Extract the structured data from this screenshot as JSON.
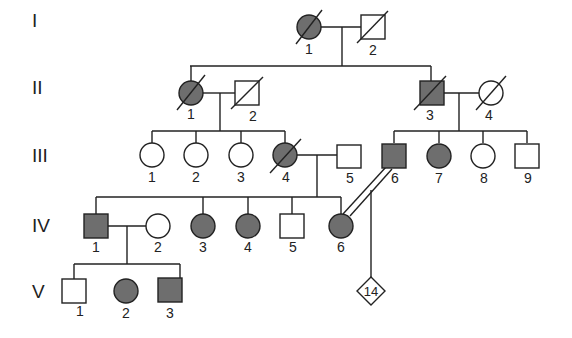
{
  "diagram": {
    "type": "pedigree",
    "colors": {
      "affected_fill": "#6e6e6e",
      "unaffected_fill": "#ffffff",
      "stroke": "#222222",
      "background": "#ffffff"
    },
    "generations": [
      {
        "label": "I",
        "y": 20
      },
      {
        "label": "II",
        "y": 86
      },
      {
        "label": "III",
        "y": 148
      },
      {
        "label": "IV",
        "y": 220
      },
      {
        "label": "V",
        "y": 286
      }
    ],
    "individuals": [
      {
        "id": "I-1",
        "label": "1",
        "sex": "female",
        "affected": true,
        "deceased": true,
        "x": 309,
        "y": 27
      },
      {
        "id": "I-2",
        "label": "2",
        "sex": "male",
        "affected": false,
        "deceased": true,
        "x": 373,
        "y": 27
      },
      {
        "id": "II-1",
        "label": "1",
        "sex": "female",
        "affected": true,
        "deceased": true,
        "x": 191,
        "y": 93
      },
      {
        "id": "II-2",
        "label": "2",
        "sex": "male",
        "affected": false,
        "deceased": true,
        "x": 247,
        "y": 93
      },
      {
        "id": "II-3",
        "label": "3",
        "sex": "male",
        "affected": true,
        "deceased": true,
        "x": 432,
        "y": 93
      },
      {
        "id": "II-4",
        "label": "4",
        "sex": "female",
        "affected": false,
        "deceased": true,
        "x": 491,
        "y": 93
      },
      {
        "id": "III-1",
        "label": "1",
        "sex": "female",
        "affected": false,
        "deceased": false,
        "x": 152,
        "y": 155
      },
      {
        "id": "III-2",
        "label": "2",
        "sex": "female",
        "affected": false,
        "deceased": false,
        "x": 196,
        "y": 155
      },
      {
        "id": "III-3",
        "label": "3",
        "sex": "female",
        "affected": false,
        "deceased": false,
        "x": 241,
        "y": 155
      },
      {
        "id": "III-4",
        "label": "4",
        "sex": "female",
        "affected": true,
        "deceased": true,
        "x": 285,
        "y": 155
      },
      {
        "id": "III-5",
        "label": "5",
        "sex": "male",
        "affected": false,
        "deceased": false,
        "x": 349,
        "y": 155
      },
      {
        "id": "III-6",
        "label": "6",
        "sex": "male",
        "affected": true,
        "deceased": false,
        "x": 394,
        "y": 155
      },
      {
        "id": "III-7",
        "label": "7",
        "sex": "female",
        "affected": true,
        "deceased": false,
        "x": 439,
        "y": 155
      },
      {
        "id": "III-8",
        "label": "8",
        "sex": "female",
        "affected": false,
        "deceased": false,
        "x": 483,
        "y": 155
      },
      {
        "id": "III-9",
        "label": "9",
        "sex": "male",
        "affected": false,
        "deceased": false,
        "x": 527,
        "y": 155
      },
      {
        "id": "IV-1",
        "label": "1",
        "sex": "male",
        "affected": true,
        "deceased": false,
        "x": 96,
        "y": 226
      },
      {
        "id": "IV-2",
        "label": "2",
        "sex": "female",
        "affected": false,
        "deceased": false,
        "x": 158,
        "y": 226
      },
      {
        "id": "IV-3",
        "label": "3",
        "sex": "female",
        "affected": true,
        "deceased": false,
        "x": 203,
        "y": 226
      },
      {
        "id": "IV-4",
        "label": "4",
        "sex": "female",
        "affected": true,
        "deceased": false,
        "x": 248,
        "y": 226
      },
      {
        "id": "IV-5",
        "label": "5",
        "sex": "male",
        "affected": false,
        "deceased": false,
        "x": 292,
        "y": 226
      },
      {
        "id": "IV-6",
        "label": "6",
        "sex": "female",
        "affected": true,
        "deceased": false,
        "x": 341,
        "y": 226
      },
      {
        "id": "V-1",
        "label": "1",
        "sex": "male",
        "affected": false,
        "deceased": false,
        "x": 74,
        "y": 291
      },
      {
        "id": "V-2",
        "label": "2",
        "sex": "female",
        "affected": true,
        "deceased": false,
        "x": 126,
        "y": 291
      },
      {
        "id": "V-3",
        "label": "3",
        "sex": "male",
        "affected": true,
        "deceased": false,
        "x": 180,
        "y": 291
      },
      {
        "id": "V-group",
        "label": "14",
        "sex": "unknown",
        "affected": false,
        "deceased": false,
        "x": 371,
        "y": 289,
        "note": "14 offspring, sex unspecified"
      }
    ],
    "unions": [
      {
        "partners": [
          "I-1",
          "I-2"
        ],
        "consanguineous": false
      },
      {
        "partners": [
          "II-1",
          "II-2"
        ],
        "consanguineous": false
      },
      {
        "partners": [
          "II-3",
          "II-4"
        ],
        "consanguineous": false
      },
      {
        "partners": [
          "III-4",
          "III-5"
        ],
        "consanguineous": false
      },
      {
        "partners": [
          "IV-1",
          "IV-2"
        ],
        "consanguineous": false
      },
      {
        "partners": [
          "III-6",
          "IV-6"
        ],
        "consanguineous": true
      }
    ]
  }
}
